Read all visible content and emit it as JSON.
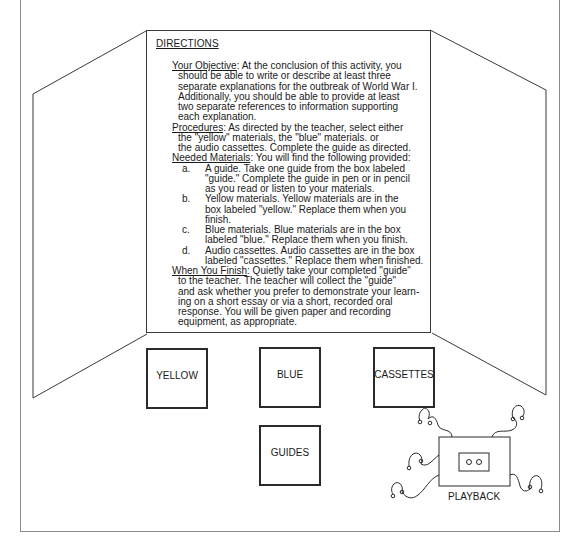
{
  "directions": {
    "title": "DIRECTIONS",
    "sections": {
      "objective": {
        "heading": "Your Objective",
        "lines": [
          ":  At the conclusion of this activity, you",
          "should be able to write or describe at least three",
          "separate explanations for the outbreak of World War I.",
          "Additionally, you should be able to provide at least",
          "two separate references to information supporting",
          "each explanation."
        ]
      },
      "procedures": {
        "heading": "Procedures",
        "lines": [
          ":  As directed by the teacher, select either",
          "the \"yellow\" materials, the \"blue\" materials. or",
          "the audio cassettes.  Complete the guide as directed."
        ]
      },
      "materials": {
        "heading": "Needed Materials",
        "intro": ":  You will find the following provided:",
        "items": [
          {
            "letter": "a.",
            "lines": [
              "A guide.  Take one guide from the box labeled",
              "\"guide.\"  Complete the guide in pen or in pencil",
              "as you read or listen to your materials."
            ]
          },
          {
            "letter": "b.",
            "lines": [
              "Yellow materials.  Yellow materials are in the",
              "box labeled \"yellow.\"  Replace them when you",
              "finish."
            ]
          },
          {
            "letter": "c.",
            "lines": [
              "Blue materials.  Blue materials are in the box",
              "labeled \"blue.\"  Replace them when you finish."
            ]
          },
          {
            "letter": "d.",
            "lines": [
              "Audio cassettes.  Audio cassettes are in the box",
              "labeled \"cassettes.\"  Replace them when finished."
            ]
          }
        ]
      },
      "finish": {
        "heading": "When You Finish",
        "lines": [
          ":  Quietly take your completed \"guide\"",
          "to the teacher.  The teacher will collect the \"guide\"",
          "and ask whether you prefer to demonstrate your learn-",
          "ing on a short essay or via a short, recorded oral",
          "response.  You will be given paper and recording",
          "equipment, as appropriate."
        ]
      }
    }
  },
  "boxes": {
    "yellow": "YELLOW",
    "blue": "BLUE",
    "cassettes": "CASSETTES",
    "guides": "GUIDES"
  },
  "playback": {
    "label": "PLAYBACK",
    "icon": "cassette-player-with-headphones"
  },
  "colors": {
    "line": "#2a2a2a",
    "outer_border": "#8a8a8a",
    "background": "#ffffff"
  }
}
